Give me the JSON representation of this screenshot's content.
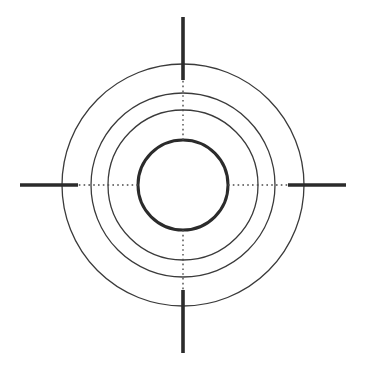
{
  "figure": {
    "name": "concentric-circle-crosshair-target",
    "width": 367,
    "height": 370,
    "background_color": "#ffffff",
    "center_x": 183,
    "center_y": 185
  },
  "chart_data": {
    "type": "scatter",
    "title": "",
    "subtitle": "",
    "xlabel": "",
    "ylabel": "",
    "grid": false,
    "legend_position": "none",
    "center": {
      "x": 183,
      "y": 185
    },
    "rings": [
      {
        "name": "inner-ring",
        "radius": 45,
        "stroke_width": 3.0,
        "stroke_color": "#2b2b2b",
        "fill": "none"
      },
      {
        "name": "second-ring",
        "radius": 75,
        "stroke_width": 1.3,
        "stroke_color": "#3a3a3a",
        "fill": "none"
      },
      {
        "name": "third-ring",
        "radius": 92,
        "stroke_width": 1.3,
        "stroke_color": "#3a3a3a",
        "fill": "none"
      },
      {
        "name": "outer-ring",
        "radius": 121,
        "stroke_width": 1.3,
        "stroke_color": "#3a3a3a",
        "fill": "none"
      }
    ],
    "ticks": [
      {
        "name": "tick-north",
        "direction": "north",
        "angle_deg": 90,
        "inner_radius": 105,
        "outer_radius": 168,
        "stroke_width": 3.6,
        "stroke_color": "#2b2b2b"
      },
      {
        "name": "tick-south",
        "direction": "south",
        "angle_deg": 270,
        "inner_radius": 105,
        "outer_radius": 168,
        "stroke_width": 3.6,
        "stroke_color": "#2b2b2b"
      },
      {
        "name": "tick-east",
        "direction": "east",
        "angle_deg": 0,
        "inner_radius": 105,
        "outer_radius": 163,
        "stroke_width": 3.6,
        "stroke_color": "#2b2b2b"
      },
      {
        "name": "tick-west",
        "direction": "west",
        "angle_deg": 180,
        "inner_radius": 105,
        "outer_radius": 163,
        "stroke_width": 3.6,
        "stroke_color": "#2b2b2b"
      }
    ],
    "axes": [
      {
        "name": "axis-dotted-horizontal",
        "orientation": "horizontal",
        "inner_radius": 45,
        "outer_radius": 152,
        "stroke_width": 1.4,
        "stroke_color": "#4a4a4a",
        "dash_pattern": "1.6 3.2"
      },
      {
        "name": "axis-dotted-vertical",
        "orientation": "vertical",
        "inner_radius": 45,
        "outer_radius": 152,
        "stroke_width": 1.4,
        "stroke_color": "#4a4a4a",
        "dash_pattern": "1.6 3.2"
      }
    ]
  }
}
